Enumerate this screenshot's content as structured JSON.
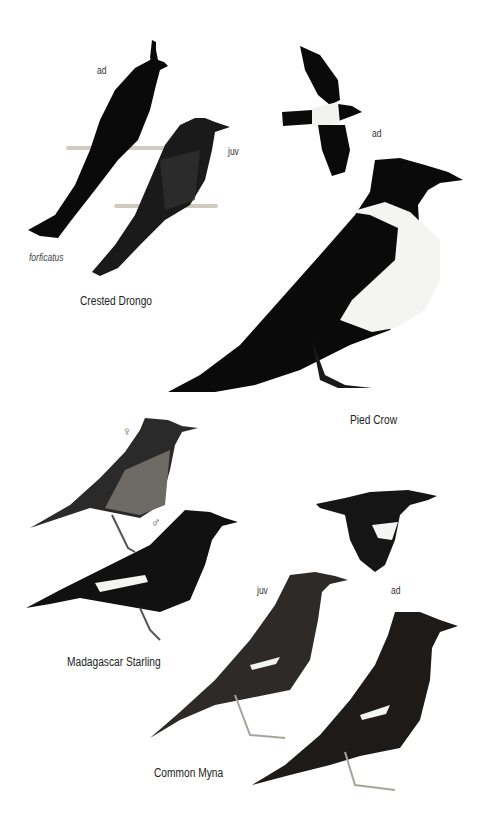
{
  "plate": {
    "species": [
      {
        "name": "Crested Drongo",
        "labels": {
          "adult": "ad",
          "juvenile": "juv",
          "subspecies": "forficatus"
        }
      },
      {
        "name": "Pied Crow",
        "labels": {
          "adult": "ad"
        }
      },
      {
        "name": "Madagascar Starling",
        "labels": {
          "female": "♀",
          "male": "♂"
        }
      },
      {
        "name": "Common Myna",
        "labels": {
          "juvenile": "juv",
          "adult": "ad"
        }
      }
    ]
  },
  "colors": {
    "ink": "#0a0a0a",
    "white_patch": "#f4f4f2",
    "perch": "#c8c4b8",
    "starling_breast": "#6e6a66",
    "myna_body": "#3a3632",
    "legs": "#a8a49c"
  }
}
